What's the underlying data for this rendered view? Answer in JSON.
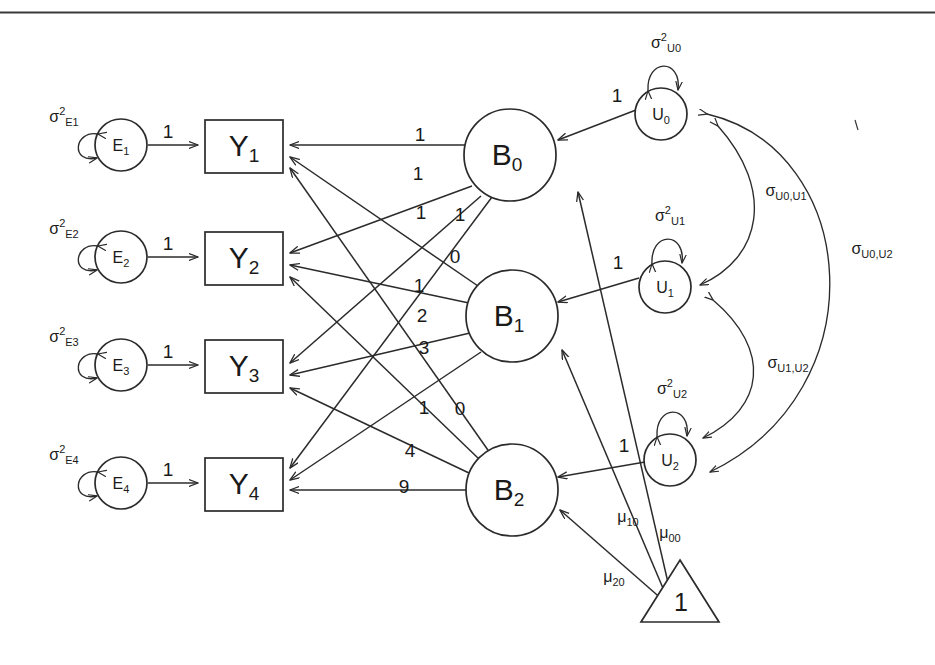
{
  "page": {
    "background_color": "#ffffff",
    "stroke_color": "#2b2b2b",
    "width": 935,
    "height": 665
  },
  "rule": {
    "name": "top-horizontal-rule"
  },
  "observed_variables": [
    {
      "id": "Y1",
      "base": "Y",
      "sub": "1"
    },
    {
      "id": "Y2",
      "base": "Y",
      "sub": "2"
    },
    {
      "id": "Y3",
      "base": "Y",
      "sub": "3"
    },
    {
      "id": "Y4",
      "base": "Y",
      "sub": "4"
    }
  ],
  "residuals": [
    {
      "id": "E1",
      "base": "E",
      "sub": "1",
      "variance_label": {
        "greek": "σ",
        "sup": "2",
        "sub": "E1"
      },
      "loading": "1"
    },
    {
      "id": "E2",
      "base": "E",
      "sub": "2",
      "variance_label": {
        "greek": "σ",
        "sup": "2",
        "sub": "E2"
      },
      "loading": "1"
    },
    {
      "id": "E3",
      "base": "E",
      "sub": "3",
      "variance_label": {
        "greek": "σ",
        "sup": "2",
        "sub": "E3"
      },
      "loading": "1"
    },
    {
      "id": "E4",
      "base": "E",
      "sub": "4",
      "variance_label": {
        "greek": "σ",
        "sup": "2",
        "sub": "E4"
      },
      "loading": "1"
    }
  ],
  "latent_factors": [
    {
      "id": "B0",
      "base": "B",
      "sub": "0"
    },
    {
      "id": "B1",
      "base": "B",
      "sub": "1"
    },
    {
      "id": "B2",
      "base": "B",
      "sub": "2"
    }
  ],
  "disturbances": [
    {
      "id": "U0",
      "base": "U",
      "sub": "0",
      "variance_label": {
        "greek": "σ",
        "sup": "2",
        "sub": "U0"
      },
      "loading": "1"
    },
    {
      "id": "U1",
      "base": "U",
      "sub": "1",
      "variance_label": {
        "greek": "σ",
        "sup": "2",
        "sub": "U1"
      },
      "loading": "1"
    },
    {
      "id": "U2",
      "base": "U",
      "sub": "2",
      "variance_label": {
        "greek": "σ",
        "sup": "2",
        "sub": "U2"
      },
      "loading": "1"
    }
  ],
  "constant": {
    "id": "triangle-1",
    "label": "1"
  },
  "means": [
    {
      "id": "mu00",
      "greek": "μ",
      "sub": "00",
      "from": "triangle-1",
      "to": "B0"
    },
    {
      "id": "mu10",
      "greek": "μ",
      "sub": "10",
      "from": "triangle-1",
      "to": "B1"
    },
    {
      "id": "mu20",
      "greek": "μ",
      "sub": "20",
      "from": "triangle-1",
      "to": "B2"
    }
  ],
  "covariances": [
    {
      "id": "cov_U0_U1",
      "greek": "σ",
      "sub": "U0,U1",
      "between": [
        "U0",
        "U1"
      ]
    },
    {
      "id": "cov_U1_U2",
      "greek": "σ",
      "sub": "U1,U2",
      "between": [
        "U1",
        "U2"
      ]
    },
    {
      "id": "cov_U0_U2",
      "greek": "σ",
      "sub": "U0,U2",
      "between": [
        "U0",
        "U2"
      ]
    }
  ],
  "factor_loadings": [
    {
      "from": "B0",
      "to": "Y1",
      "value": "1"
    },
    {
      "from": "B0",
      "to": "Y2",
      "value": "1"
    },
    {
      "from": "B0",
      "to": "Y3",
      "value": "1"
    },
    {
      "from": "B0",
      "to": "Y4",
      "value": "1"
    },
    {
      "from": "B1",
      "to": "Y1",
      "value": "0"
    },
    {
      "from": "B1",
      "to": "Y2",
      "value": "1"
    },
    {
      "from": "B1",
      "to": "Y3",
      "value": "2"
    },
    {
      "from": "B1",
      "to": "Y4",
      "value": "3"
    },
    {
      "from": "B2",
      "to": "Y1",
      "value": "0"
    },
    {
      "from": "B2",
      "to": "Y2",
      "value": "1"
    },
    {
      "from": "B2",
      "to": "Y3",
      "value": "4"
    },
    {
      "from": "B2",
      "to": "Y4",
      "value": "9"
    }
  ],
  "path_label_layout": [
    {
      "key": "b0y1",
      "value": "1",
      "x": 420,
      "y": 136
    },
    {
      "key": "b0y2",
      "value": "1",
      "x": 418,
      "y": 175
    },
    {
      "key": "b0y3",
      "value": "1",
      "x": 421,
      "y": 214
    },
    {
      "key": "b0y4",
      "value": "1",
      "x": 460,
      "y": 216
    },
    {
      "key": "b1y1",
      "value": "0",
      "x": 455,
      "y": 258
    },
    {
      "key": "b1y2",
      "value": "1",
      "x": 419,
      "y": 287
    },
    {
      "key": "b1y3",
      "value": "2",
      "x": 422,
      "y": 317
    },
    {
      "key": "b1y4",
      "value": "3",
      "x": 424,
      "y": 349
    },
    {
      "key": "b2y1",
      "value": "0",
      "x": 460,
      "y": 410
    },
    {
      "key": "b2y2",
      "value": "1",
      "x": 424,
      "y": 409
    },
    {
      "key": "b2y3",
      "value": "4",
      "x": 410,
      "y": 452
    },
    {
      "key": "b2y4",
      "value": "9",
      "x": 404,
      "y": 488
    }
  ],
  "loading_label_layout": [
    {
      "key": "e1y1",
      "value": "1",
      "x": 168,
      "y": 140
    },
    {
      "key": "e2y2",
      "value": "1",
      "x": 168,
      "y": 252
    },
    {
      "key": "e3y3",
      "value": "1",
      "x": 168,
      "y": 360
    },
    {
      "key": "e4y4",
      "value": "1",
      "x": 168,
      "y": 478
    },
    {
      "key": "u0b0",
      "value": "1",
      "x": 617,
      "y": 105
    },
    {
      "key": "u1b1",
      "value": "1",
      "x": 618,
      "y": 272
    },
    {
      "key": "u2b2",
      "value": "1",
      "x": 624,
      "y": 455
    }
  ]
}
